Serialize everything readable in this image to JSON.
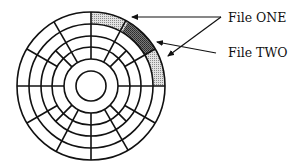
{
  "diagram": {
    "disk": {
      "center": [
        91,
        86
      ],
      "ring_radii": [
        74,
        62,
        50,
        39,
        27,
        15
      ],
      "sector_count": 12,
      "stroke_color": "#111111"
    },
    "allocated_sectors": [
      {
        "file": "File ONE",
        "ring": "outer",
        "start_deg": 0,
        "end_deg": 30,
        "fill": "light-stipple"
      },
      {
        "file": "File TWO",
        "ring": "outer",
        "start_deg": 30,
        "end_deg": 60,
        "fill": "dark-stipple"
      },
      {
        "file": "File ONE",
        "ring": "outer",
        "start_deg": 60,
        "end_deg": 90,
        "fill": "light-stipple"
      }
    ],
    "labels": {
      "file_one": "File ONE",
      "file_two": "File TWO"
    },
    "colors": {
      "light_fill": "#c8c8c8",
      "dark_fill": "#6e6e6e",
      "line": "#111111",
      "background": "#ffffff"
    }
  }
}
